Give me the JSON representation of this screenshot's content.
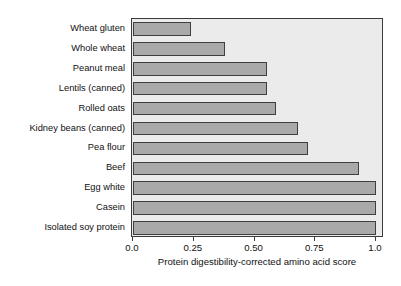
{
  "chart_data": {
    "type": "bar",
    "orientation": "horizontal",
    "title": "",
    "xlabel": "Protein digestibility-corrected amino acid score",
    "ylabel": "",
    "categories": [
      "Wheat gluten",
      "Whole wheat",
      "Peanut meal",
      "Lentils (canned)",
      "Rolled oats",
      "Kidney beans (canned)",
      "Pea flour",
      "Beef",
      "Egg white",
      "Casein",
      "Isolated soy protein"
    ],
    "values": [
      0.24,
      0.38,
      0.55,
      0.55,
      0.59,
      0.68,
      0.72,
      0.93,
      1.0,
      1.0,
      1.0
    ],
    "xlim": [
      0.0,
      1.0
    ],
    "xticks": [
      0.0,
      0.25,
      0.5,
      0.75,
      1.0
    ],
    "xtick_labels": [
      "0.0",
      "0.25",
      "0.50",
      "0.75",
      "1.0"
    ],
    "grid": false,
    "legend": null,
    "colors": {
      "bar_fill": "#a9a9a9",
      "bar_edge": "#3f3f3f",
      "plot_background": "#ebebeb",
      "axis": "#3a3a3a",
      "text": "#111111",
      "figure_background": "#ffffff"
    }
  }
}
